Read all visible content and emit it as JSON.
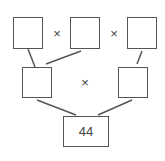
{
  "diagram": {
    "operator": "×",
    "top_row": [
      {
        "id": "top-left",
        "value": ""
      },
      {
        "id": "top-middle",
        "value": ""
      },
      {
        "id": "top-right",
        "value": ""
      }
    ],
    "middle_row": [
      {
        "id": "middle-left",
        "value": ""
      },
      {
        "id": "middle-right",
        "value": ""
      }
    ],
    "bottom": {
      "id": "result",
      "value": "44"
    },
    "colors": {
      "line": "#555555",
      "text": "#444444",
      "background": "#ffffff"
    }
  }
}
